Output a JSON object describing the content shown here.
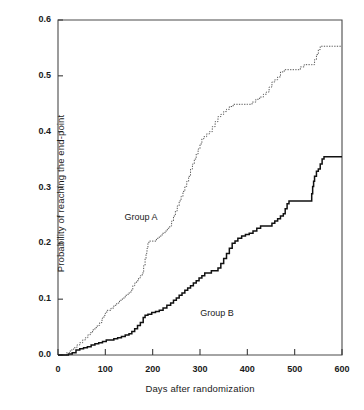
{
  "chart_data": {
    "type": "line",
    "title": "",
    "xlabel": "Days after randomization",
    "ylabel": "Probability of reaching the end-point",
    "xlim": [
      0,
      600
    ],
    "ylim": [
      0.0,
      0.6
    ],
    "grid": false,
    "legend_position": "inline-annotation",
    "xticks": [
      0,
      100,
      200,
      300,
      400,
      500,
      600
    ],
    "xtick_labels": [
      "0",
      "100",
      "200",
      "300",
      "400",
      "500",
      "600"
    ],
    "yticks": [
      0.0,
      0.1,
      0.2,
      0.3,
      0.4,
      0.5,
      0.6
    ],
    "ytick_labels": [
      "0.0",
      "0.1",
      "0.2",
      "0.3",
      "0.4",
      "0.5",
      "0.6"
    ],
    "annotations": [
      {
        "text": "Group A",
        "x": 185,
        "y": 0.245
      },
      {
        "text": "Group B",
        "x": 345,
        "y": 0.073
      }
    ],
    "series": [
      {
        "name": "Group A",
        "style": "dotted",
        "color": "#555555",
        "final_value": 0.553,
        "points": [
          [
            0,
            0.0
          ],
          [
            10,
            0.0
          ],
          [
            18,
            0.004
          ],
          [
            26,
            0.009
          ],
          [
            33,
            0.013
          ],
          [
            40,
            0.018
          ],
          [
            46,
            0.022
          ],
          [
            52,
            0.027
          ],
          [
            58,
            0.031
          ],
          [
            63,
            0.036
          ],
          [
            68,
            0.04
          ],
          [
            73,
            0.045
          ],
          [
            78,
            0.049
          ],
          [
            83,
            0.053
          ],
          [
            88,
            0.058
          ],
          [
            93,
            0.066
          ],
          [
            97,
            0.071
          ],
          [
            100,
            0.075
          ],
          [
            103,
            0.08
          ],
          [
            106,
            0.08
          ],
          [
            112,
            0.084
          ],
          [
            118,
            0.089
          ],
          [
            124,
            0.093
          ],
          [
            130,
            0.098
          ],
          [
            136,
            0.102
          ],
          [
            142,
            0.107
          ],
          [
            148,
            0.111
          ],
          [
            154,
            0.116
          ],
          [
            158,
            0.124
          ],
          [
            162,
            0.129
          ],
          [
            166,
            0.133
          ],
          [
            170,
            0.138
          ],
          [
            174,
            0.142
          ],
          [
            178,
            0.147
          ],
          [
            181,
            0.16
          ],
          [
            184,
            0.173
          ],
          [
            186,
            0.182
          ],
          [
            188,
            0.191
          ],
          [
            190,
            0.2
          ],
          [
            192,
            0.204
          ],
          [
            196,
            0.204
          ],
          [
            202,
            0.204
          ],
          [
            208,
            0.209
          ],
          [
            214,
            0.213
          ],
          [
            220,
            0.218
          ],
          [
            226,
            0.222
          ],
          [
            231,
            0.227
          ],
          [
            236,
            0.231
          ],
          [
            240,
            0.24
          ],
          [
            244,
            0.249
          ],
          [
            248,
            0.258
          ],
          [
            252,
            0.267
          ],
          [
            256,
            0.276
          ],
          [
            260,
            0.284
          ],
          [
            264,
            0.293
          ],
          [
            268,
            0.302
          ],
          [
            272,
            0.311
          ],
          [
            276,
            0.32
          ],
          [
            280,
            0.333
          ],
          [
            284,
            0.342
          ],
          [
            288,
            0.351
          ],
          [
            292,
            0.36
          ],
          [
            296,
            0.369
          ],
          [
            300,
            0.378
          ],
          [
            304,
            0.387
          ],
          [
            308,
            0.391
          ],
          [
            314,
            0.396
          ],
          [
            320,
            0.4
          ],
          [
            326,
            0.409
          ],
          [
            332,
            0.418
          ],
          [
            338,
            0.427
          ],
          [
            344,
            0.431
          ],
          [
            350,
            0.436
          ],
          [
            356,
            0.44
          ],
          [
            362,
            0.445
          ],
          [
            370,
            0.449
          ],
          [
            378,
            0.449
          ],
          [
            390,
            0.449
          ],
          [
            400,
            0.449
          ],
          [
            410,
            0.453
          ],
          [
            418,
            0.458
          ],
          [
            426,
            0.462
          ],
          [
            434,
            0.467
          ],
          [
            440,
            0.471
          ],
          [
            446,
            0.48
          ],
          [
            452,
            0.489
          ],
          [
            458,
            0.493
          ],
          [
            464,
            0.498
          ],
          [
            470,
            0.507
          ],
          [
            478,
            0.511
          ],
          [
            488,
            0.511
          ],
          [
            500,
            0.511
          ],
          [
            512,
            0.516
          ],
          [
            520,
            0.52
          ],
          [
            528,
            0.52
          ],
          [
            536,
            0.52
          ],
          [
            542,
            0.529
          ],
          [
            546,
            0.538
          ],
          [
            550,
            0.547
          ],
          [
            554,
            0.553
          ],
          [
            560,
            0.553
          ],
          [
            580,
            0.553
          ],
          [
            600,
            0.553
          ]
        ]
      },
      {
        "name": "Group B",
        "style": "solid",
        "color": "#111111",
        "final_value": 0.355,
        "points": [
          [
            0,
            0.0
          ],
          [
            14,
            0.0
          ],
          [
            22,
            0.002
          ],
          [
            30,
            0.004
          ],
          [
            38,
            0.009
          ],
          [
            46,
            0.011
          ],
          [
            54,
            0.013
          ],
          [
            62,
            0.015
          ],
          [
            70,
            0.018
          ],
          [
            78,
            0.02
          ],
          [
            86,
            0.022
          ],
          [
            94,
            0.024
          ],
          [
            102,
            0.027
          ],
          [
            110,
            0.027
          ],
          [
            118,
            0.029
          ],
          [
            126,
            0.031
          ],
          [
            134,
            0.033
          ],
          [
            142,
            0.036
          ],
          [
            150,
            0.038
          ],
          [
            156,
            0.042
          ],
          [
            162,
            0.047
          ],
          [
            168,
            0.053
          ],
          [
            174,
            0.058
          ],
          [
            180,
            0.067
          ],
          [
            184,
            0.071
          ],
          [
            190,
            0.073
          ],
          [
            198,
            0.076
          ],
          [
            206,
            0.078
          ],
          [
            214,
            0.08
          ],
          [
            222,
            0.084
          ],
          [
            230,
            0.089
          ],
          [
            238,
            0.093
          ],
          [
            244,
            0.098
          ],
          [
            250,
            0.102
          ],
          [
            256,
            0.107
          ],
          [
            262,
            0.111
          ],
          [
            268,
            0.116
          ],
          [
            274,
            0.12
          ],
          [
            280,
            0.124
          ],
          [
            286,
            0.129
          ],
          [
            292,
            0.133
          ],
          [
            298,
            0.138
          ],
          [
            304,
            0.142
          ],
          [
            310,
            0.147
          ],
          [
            316,
            0.147
          ],
          [
            324,
            0.151
          ],
          [
            330,
            0.151
          ],
          [
            338,
            0.156
          ],
          [
            344,
            0.164
          ],
          [
            350,
            0.173
          ],
          [
            356,
            0.182
          ],
          [
            362,
            0.191
          ],
          [
            368,
            0.2
          ],
          [
            374,
            0.204
          ],
          [
            380,
            0.209
          ],
          [
            388,
            0.213
          ],
          [
            396,
            0.216
          ],
          [
            404,
            0.218
          ],
          [
            412,
            0.222
          ],
          [
            420,
            0.227
          ],
          [
            428,
            0.231
          ],
          [
            436,
            0.231
          ],
          [
            446,
            0.231
          ],
          [
            452,
            0.236
          ],
          [
            458,
            0.24
          ],
          [
            464,
            0.244
          ],
          [
            470,
            0.249
          ],
          [
            476,
            0.253
          ],
          [
            480,
            0.262
          ],
          [
            484,
            0.271
          ],
          [
            488,
            0.276
          ],
          [
            496,
            0.276
          ],
          [
            510,
            0.276
          ],
          [
            524,
            0.276
          ],
          [
            532,
            0.276
          ],
          [
            536,
            0.289
          ],
          [
            538,
            0.302
          ],
          [
            540,
            0.311
          ],
          [
            542,
            0.32
          ],
          [
            546,
            0.329
          ],
          [
            550,
            0.333
          ],
          [
            554,
            0.342
          ],
          [
            558,
            0.351
          ],
          [
            562,
            0.355
          ],
          [
            570,
            0.355
          ],
          [
            585,
            0.355
          ],
          [
            600,
            0.355
          ]
        ]
      }
    ]
  },
  "axes": {
    "plot_left_px": 58,
    "plot_right_px": 342,
    "plot_top_px": 20,
    "plot_bottom_px": 355
  }
}
